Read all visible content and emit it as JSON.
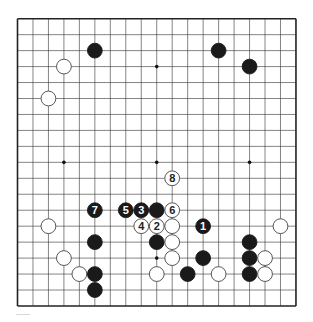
{
  "diagram": {
    "board_size": 19,
    "geometry": {
      "left": 17.5,
      "top": 18.7,
      "dx": 15.47,
      "dy": 15.96,
      "stone_radius": 7.4
    },
    "colors": {
      "black": "#1a1a1a",
      "white": "#ffffff",
      "line": "#333333",
      "border": "#222222"
    },
    "star_points": [
      [
        3,
        3
      ],
      [
        9,
        3
      ],
      [
        15,
        3
      ],
      [
        3,
        9
      ],
      [
        9,
        9
      ],
      [
        15,
        9
      ],
      [
        3,
        15
      ],
      [
        9,
        15
      ],
      [
        15,
        15
      ]
    ],
    "stones": [
      {
        "c": 5,
        "r": 2,
        "color": "black"
      },
      {
        "c": 13,
        "r": 2,
        "color": "black"
      },
      {
        "c": 15,
        "r": 3,
        "color": "black"
      },
      {
        "c": 3,
        "r": 3,
        "color": "white"
      },
      {
        "c": 2,
        "r": 5,
        "color": "white"
      },
      {
        "c": 9,
        "r": 12,
        "color": "black"
      },
      {
        "c": 2,
        "r": 13,
        "color": "white"
      },
      {
        "c": 10,
        "r": 13,
        "color": "white"
      },
      {
        "c": 17,
        "r": 13,
        "color": "white"
      },
      {
        "c": 5,
        "r": 14,
        "color": "black"
      },
      {
        "c": 9,
        "r": 14,
        "color": "black"
      },
      {
        "c": 10,
        "r": 14,
        "color": "white"
      },
      {
        "c": 15,
        "r": 14,
        "color": "black"
      },
      {
        "c": 3,
        "r": 15,
        "color": "white"
      },
      {
        "c": 10,
        "r": 15,
        "color": "white"
      },
      {
        "c": 12,
        "r": 15,
        "color": "black"
      },
      {
        "c": 15,
        "r": 15,
        "color": "black"
      },
      {
        "c": 16,
        "r": 15,
        "color": "white"
      },
      {
        "c": 4,
        "r": 16,
        "color": "white"
      },
      {
        "c": 5,
        "r": 16,
        "color": "black"
      },
      {
        "c": 9,
        "r": 16,
        "color": "white"
      },
      {
        "c": 11,
        "r": 16,
        "color": "black"
      },
      {
        "c": 13,
        "r": 16,
        "color": "white"
      },
      {
        "c": 15,
        "r": 16,
        "color": "black"
      },
      {
        "c": 16,
        "r": 16,
        "color": "white"
      },
      {
        "c": 5,
        "r": 17,
        "color": "black"
      }
    ],
    "moves": [
      {
        "n": "1",
        "c": 12,
        "r": 13,
        "color": "black"
      },
      {
        "n": "2",
        "c": 9,
        "r": 13,
        "color": "white"
      },
      {
        "n": "3",
        "c": 8,
        "r": 12,
        "color": "black"
      },
      {
        "n": "4",
        "c": 8,
        "r": 13,
        "color": "white"
      },
      {
        "n": "5",
        "c": 7,
        "r": 12,
        "color": "black"
      },
      {
        "n": "6",
        "c": 10,
        "r": 12,
        "color": "white"
      },
      {
        "n": "7",
        "c": 5,
        "r": 12,
        "color": "black"
      },
      {
        "n": "8",
        "c": 10,
        "r": 10,
        "color": "white"
      }
    ]
  }
}
